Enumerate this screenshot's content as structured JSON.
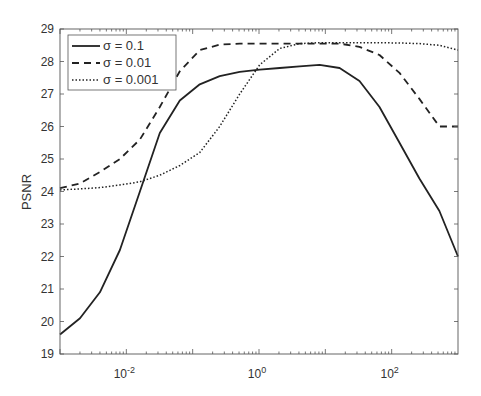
{
  "chart_data": {
    "type": "line",
    "title": "",
    "xlabel": "",
    "ylabel": "PSNR",
    "xscale": "log",
    "xlim": [
      0.001,
      1000
    ],
    "ylim": [
      19,
      29
    ],
    "grid": false,
    "legend_position": "upper left",
    "x_tick_labels": [
      {
        "value": 0.01,
        "base": "10",
        "exp": "-2"
      },
      {
        "value": 1,
        "base": "10",
        "exp": "0"
      },
      {
        "value": 100,
        "base": "10",
        "exp": "2"
      }
    ],
    "y_ticks": [
      19,
      20,
      21,
      22,
      23,
      24,
      25,
      26,
      27,
      28,
      29
    ],
    "x": [
      0.001,
      0.002,
      0.004,
      0.008,
      0.016,
      0.032,
      0.064,
      0.128,
      0.256,
      0.512,
      1.024,
      2.048,
      4.096,
      8.192,
      16.384,
      32.768,
      65.536,
      131.072,
      262.144,
      524.288,
      1000
    ],
    "series": [
      {
        "name": "σ = 0.1",
        "style": "solid",
        "values": [
          19.6,
          20.1,
          20.9,
          22.2,
          24.0,
          25.8,
          26.8,
          27.3,
          27.55,
          27.68,
          27.75,
          27.8,
          27.85,
          27.9,
          27.8,
          27.4,
          26.6,
          25.5,
          24.4,
          23.4,
          22.0
        ]
      },
      {
        "name": "σ = 0.01",
        "style": "dashed",
        "values": [
          24.1,
          24.25,
          24.6,
          25.0,
          25.6,
          26.6,
          27.7,
          28.35,
          28.52,
          28.55,
          28.55,
          28.55,
          28.55,
          28.55,
          28.55,
          28.45,
          28.2,
          27.65,
          26.85,
          26.0,
          26.0
        ]
      },
      {
        "name": "σ = 0.001",
        "style": "dotted",
        "values": [
          24.05,
          24.08,
          24.12,
          24.2,
          24.3,
          24.5,
          24.8,
          25.2,
          26.0,
          27.0,
          27.9,
          28.4,
          28.55,
          28.58,
          28.58,
          28.58,
          28.58,
          28.57,
          28.55,
          28.5,
          28.35
        ]
      }
    ]
  },
  "legend": {
    "items": [
      {
        "label": "σ = 0.1"
      },
      {
        "label": "σ = 0.01"
      },
      {
        "label": "σ = 0.001"
      }
    ]
  },
  "axes": {
    "ylabel": "PSNR"
  },
  "colors": {
    "line": "#222222",
    "axis": "#555555",
    "text": "#333333"
  }
}
